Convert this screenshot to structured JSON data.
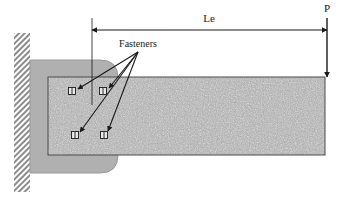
{
  "diagram": {
    "labels": {
      "dimension_le": "Le",
      "load_p": "P",
      "fasteners": "Fasteners"
    },
    "colors": {
      "line": "#1a1a1a",
      "bracket_fill": "#b0b0b0",
      "bracket_stroke": "#8a8a8a",
      "plate_fill": "#a8a8a8",
      "plate_stroke": "#4a4a4a",
      "wall_hatch": "#8c8c8c",
      "background": "#ffffff"
    },
    "wall": {
      "x": 14,
      "y": 33,
      "width": 16,
      "height": 159,
      "hatch_pattern": "cross-hatch"
    },
    "bracket": {
      "x": 30,
      "y": 60,
      "width": 88,
      "height": 113,
      "corner_radius": 18
    },
    "plate": {
      "x": 48,
      "y": 77,
      "width": 277,
      "height": 78,
      "texture": "speckled-concrete"
    },
    "dimension_line": {
      "y": 30,
      "x_start": 92,
      "x_end": 327,
      "extension_left_x": 92,
      "extension_left_y_top": 18,
      "extension_left_y_bottom": 105,
      "extension_right_x": 327,
      "extension_right_y_top": 18,
      "extension_right_y_bottom": 77
    },
    "load_arrow": {
      "x": 327,
      "y_start": 18,
      "y_end": 77,
      "direction": "down"
    },
    "fasteners": [
      {
        "id": "fastener-top-left",
        "cx": 72,
        "cy": 91
      },
      {
        "id": "fastener-top-right",
        "cx": 103,
        "cy": 91
      },
      {
        "id": "fastener-bottom-left",
        "cx": 75,
        "cy": 135
      },
      {
        "id": "fastener-bottom-right",
        "cx": 104,
        "cy": 135
      }
    ],
    "leader_origin": {
      "x": 138,
      "y": 52
    }
  }
}
